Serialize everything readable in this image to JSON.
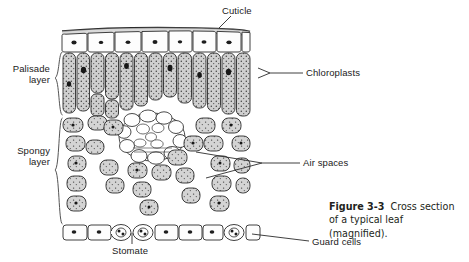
{
  "figure": {
    "caption_label": "Figure 3-3",
    "caption_text": "Cross section of a typical leaf (magnified)."
  },
  "labels": {
    "cuticle": "Cuticle",
    "chloroplasts": "Chloroplasts",
    "air_spaces": "Air spaces",
    "guard_cells": "Guard cells",
    "stomate": "Stomate",
    "palisade_line1": "Palisade",
    "palisade_line2": "layer",
    "spongy_line1": "Spongy",
    "spongy_line2": "layer"
  },
  "colors": {
    "ink": "#1a1a1a",
    "cell_fill_gray": "#c9c9c9",
    "cell_fill_white": "#ffffff",
    "background": "#ffffff",
    "caption_ink": "#231f20"
  }
}
